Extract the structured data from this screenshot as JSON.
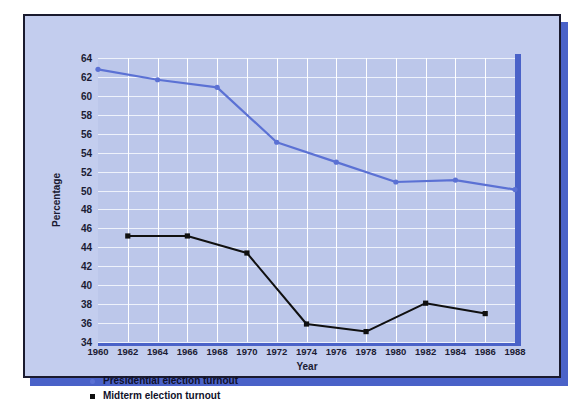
{
  "chart_data": {
    "type": "line",
    "title": "",
    "xlabel": "Year",
    "ylabel": "Percentage",
    "xlim": [
      1960,
      1988
    ],
    "ylim": [
      34,
      64
    ],
    "ytick_step": 2,
    "xtick_step": 2,
    "grid": true,
    "legend_position": "below-axis-left",
    "xticks": [
      "1960",
      "1962",
      "1964",
      "1966",
      "1968",
      "1970",
      "1972",
      "1974",
      "1976",
      "1978",
      "1980",
      "1982",
      "1984",
      "1986",
      "1988"
    ],
    "yticks": [
      "34",
      "36",
      "38",
      "40",
      "42",
      "44",
      "46",
      "48",
      "50",
      "52",
      "54",
      "56",
      "58",
      "60",
      "62",
      "64"
    ],
    "series": [
      {
        "name": "Presidential election turnout",
        "color": "#5b71d4",
        "marker": "circle",
        "x": [
          1960,
          1964,
          1968,
          1972,
          1976,
          1980,
          1984,
          1988
        ],
        "values": [
          62.8,
          61.7,
          60.9,
          55.1,
          53.0,
          50.9,
          51.1,
          50.1
        ]
      },
      {
        "name": "Midterm election turnout",
        "color": "#101010",
        "marker": "square",
        "x": [
          1962,
          1966,
          1970,
          1974,
          1978,
          1982,
          1986
        ],
        "values": [
          45.2,
          45.2,
          43.4,
          35.9,
          35.1,
          38.1,
          37.0
        ]
      }
    ]
  },
  "legend": {
    "items": [
      {
        "label": "Presidential election turnout",
        "marker": "dot-marker"
      },
      {
        "label": "Midterm election turnout",
        "marker": "square-marker"
      }
    ]
  },
  "colors": {
    "card_background": "#c3cdee",
    "plot_background": "#bcc7ea",
    "accent_blue": "#4a62c8",
    "presidential_line": "#5b71d4",
    "midterm_line": "#101010",
    "frame_border": "#1a1a2e"
  }
}
